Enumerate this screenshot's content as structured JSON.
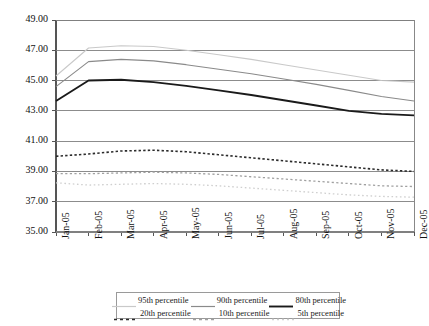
{
  "chart_data": {
    "type": "line",
    "title": "",
    "xlabel": "",
    "ylabel": "",
    "ylim": [
      35.0,
      49.0
    ],
    "ytick_step": 2.0,
    "grid": true,
    "legend_position": "bottom",
    "categories": [
      "Jan-05",
      "Feb-05",
      "Mar-05",
      "Apr-05",
      "May-05",
      "Jun-05",
      "Jul-05",
      "Aug-05",
      "Sep-05",
      "Oct-05",
      "Nov-05",
      "Dec-05"
    ],
    "yticks": [
      "35.00",
      "37.00",
      "39.00",
      "41.00",
      "43.00",
      "45.00",
      "47.00",
      "49.00"
    ],
    "series": [
      {
        "name": "95th percentile",
        "style": "solid",
        "color": "#c9c9c9",
        "width": 1.1,
        "values": [
          45.3,
          47.15,
          47.3,
          47.25,
          47.0,
          46.7,
          46.4,
          46.05,
          45.7,
          45.35,
          45.0,
          44.9
        ]
      },
      {
        "name": "90th percentile",
        "style": "solid",
        "color": "#8a8a8a",
        "width": 1.1,
        "values": [
          44.6,
          46.25,
          46.4,
          46.3,
          46.05,
          45.75,
          45.45,
          45.1,
          44.75,
          44.35,
          43.95,
          43.65
        ]
      },
      {
        "name": "80th percentile",
        "style": "solid",
        "color": "#1a1a1a",
        "width": 1.9,
        "values": [
          43.65,
          45.0,
          45.05,
          44.9,
          44.65,
          44.35,
          44.05,
          43.7,
          43.35,
          43.0,
          42.8,
          42.7
        ]
      },
      {
        "name": "20th percentile",
        "style": "dashed",
        "color": "#2b2b2b",
        "width": 1.6,
        "values": [
          40.0,
          40.15,
          40.35,
          40.4,
          40.3,
          40.1,
          39.9,
          39.7,
          39.5,
          39.3,
          39.1,
          39.0
        ]
      },
      {
        "name": "10th percentile",
        "style": "dashed",
        "color": "#a0a0a0",
        "width": 1.3,
        "values": [
          38.85,
          38.85,
          38.9,
          38.95,
          38.9,
          38.8,
          38.65,
          38.5,
          38.35,
          38.2,
          38.05,
          38.0
        ]
      },
      {
        "name": "5th percentile",
        "style": "dotted",
        "color": "#cfcfcf",
        "width": 1.3,
        "values": [
          38.25,
          38.1,
          38.15,
          38.2,
          38.15,
          38.05,
          37.9,
          37.75,
          37.6,
          37.45,
          37.35,
          37.3
        ]
      }
    ]
  }
}
